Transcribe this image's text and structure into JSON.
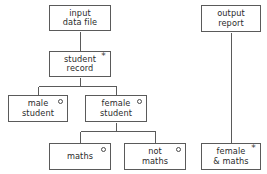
{
  "diagram": {
    "type": "tree",
    "colors": {
      "box_border": "#5a5a5a",
      "connector": "#5a5a5a",
      "text": "#2b2b2b",
      "background": "#ffffff"
    },
    "marker_legend": {
      "asterisk": "*",
      "circle": "o"
    },
    "nodes": [
      {
        "id": "input-data-file",
        "label": "input\ndata file",
        "marker": "none",
        "marker_glyph": "",
        "x": 49,
        "y": 5,
        "width": 62,
        "height": 26
      },
      {
        "id": "student-record",
        "label": "student\nrecord",
        "marker": "asterisk",
        "marker_glyph": "*",
        "x": 49,
        "y": 51,
        "width": 62,
        "height": 26
      },
      {
        "id": "male-student",
        "label": "male\nstudent",
        "marker": "circle",
        "marker_glyph": "o",
        "x": 8,
        "y": 95,
        "width": 60,
        "height": 27
      },
      {
        "id": "female-student",
        "label": "female\nstudent",
        "marker": "circle",
        "marker_glyph": "o",
        "x": 85,
        "y": 95,
        "width": 62,
        "height": 27
      },
      {
        "id": "maths",
        "label": "maths",
        "marker": "circle",
        "marker_glyph": "o",
        "x": 49,
        "y": 143,
        "width": 62,
        "height": 27
      },
      {
        "id": "not-maths",
        "label": "not\nmaths",
        "marker": "circle",
        "marker_glyph": "o",
        "x": 124,
        "y": 143,
        "width": 62,
        "height": 27
      },
      {
        "id": "output-report",
        "label": "output\nreport",
        "marker": "none",
        "marker_glyph": "",
        "x": 201,
        "y": 5,
        "width": 60,
        "height": 27
      },
      {
        "id": "female-and-maths",
        "label": "female\n& maths",
        "marker": "asterisk",
        "marker_glyph": "*",
        "x": 201,
        "y": 143,
        "width": 60,
        "height": 27
      }
    ],
    "edges": [
      {
        "id": "edge-input-to-student",
        "from": "input-data-file",
        "to": "student-record",
        "kind": "vertical"
      },
      {
        "id": "edge-student-to-male",
        "from": "student-record",
        "to": "male-student",
        "kind": "branch"
      },
      {
        "id": "edge-student-to-female",
        "from": "student-record",
        "to": "female-student",
        "kind": "branch"
      },
      {
        "id": "edge-female-to-maths",
        "from": "female-student",
        "to": "maths",
        "kind": "branch"
      },
      {
        "id": "edge-female-to-not-maths",
        "from": "female-student",
        "to": "not-maths",
        "kind": "branch"
      },
      {
        "id": "edge-output-to-female-maths",
        "from": "output-report",
        "to": "female-and-maths",
        "kind": "vertical"
      }
    ],
    "edge_paths": [
      "M 80 31 L 80 51",
      "M 80 77 L 80 86 M 38 86 L 116 86 M 38 86 L 38 95 M 116 86 L 116 95",
      "M 116 122 L 116 131 M 80 131 L 155 131 M 80 131 L 80 143 M 155 131 L 155 143",
      "M 231 32 L 231 143"
    ]
  }
}
